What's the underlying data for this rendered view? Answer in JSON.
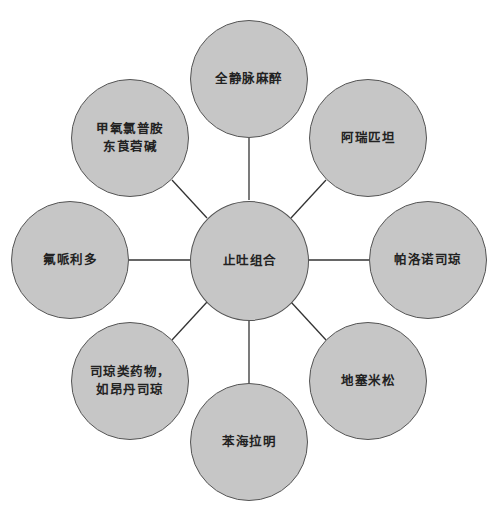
{
  "diagram": {
    "type": "hub-and-spoke",
    "colors": {
      "node_fill": "#c6c6c6",
      "node_stroke": "#555555",
      "line": "#333333",
      "text": "#222222"
    },
    "center": {
      "label": "止吐组合",
      "cx": 249,
      "cy": 260
    },
    "nodes": [
      {
        "id": "top",
        "label": "全静脉麻醉",
        "cx": 249,
        "cy": 79
      },
      {
        "id": "upper-right",
        "label": "阿瑞匹坦",
        "cx": 368,
        "cy": 138
      },
      {
        "id": "right",
        "label": "帕洛诺司琼",
        "cx": 428,
        "cy": 260
      },
      {
        "id": "lower-right",
        "label": "地塞米松",
        "cx": 368,
        "cy": 382
      },
      {
        "id": "bottom",
        "label": "苯海拉明",
        "cx": 249,
        "cy": 443
      },
      {
        "id": "lower-left",
        "label": "司琼类药物，\n如昂丹司琼",
        "cx": 130,
        "cy": 382
      },
      {
        "id": "left",
        "label": "氟哌利多",
        "cx": 70,
        "cy": 260
      },
      {
        "id": "upper-left",
        "label": "甲氧氯普胺\n东莨菪碱",
        "cx": 130,
        "cy": 138
      }
    ]
  }
}
